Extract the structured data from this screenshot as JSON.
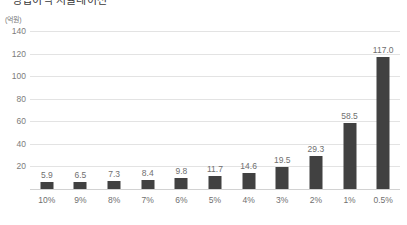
{
  "title": {
    "text": "영업이익 시뮬레이션",
    "cropped": true
  },
  "chart_data": {
    "type": "bar",
    "title": "영업이익 시뮬레이션",
    "unit_label": "(억원)",
    "xlabel": "",
    "ylabel": "",
    "categories": [
      "10%",
      "9%",
      "8%",
      "7%",
      "6%",
      "5%",
      "4%",
      "3%",
      "2%",
      "1%",
      "0.5%"
    ],
    "values": [
      5.9,
      6.5,
      7.3,
      8.4,
      9.8,
      11.7,
      14.6,
      19.5,
      29.3,
      58.5,
      117.0
    ],
    "value_labels": [
      "5.9",
      "6.5",
      "7.3",
      "8.4",
      "9.8",
      "11.7",
      "14.6",
      "19.5",
      "29.3",
      "58.5",
      "117.0"
    ],
    "ylim": [
      0,
      140
    ],
    "yticks": [
      140,
      120,
      100,
      80,
      60,
      40,
      20
    ],
    "ytick_labels": [
      "140",
      "120",
      "100",
      "80",
      "60",
      "40",
      "20"
    ],
    "grid": "horizontal",
    "legend": "none",
    "bar_color": "#414141",
    "gridline_color": "#e3e3e3",
    "axis_text_color": "#6f6f6f",
    "background_color": "#ffffff"
  }
}
